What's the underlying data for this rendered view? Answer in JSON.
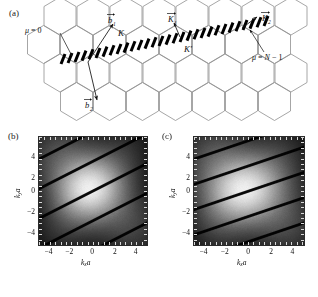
{
  "figure": {
    "panels": [
      {
        "id": "a",
        "label": "(a)",
        "type": "lattice-diagram"
      },
      {
        "id": "b",
        "label": "(b)",
        "type": "heatmap"
      },
      {
        "id": "c",
        "label": "(c)",
        "type": "heatmap"
      }
    ]
  },
  "panel_a": {
    "label": "(a)",
    "description": "Hexagonal reciprocal lattice of graphene with cutting lines",
    "annotations": [
      {
        "name": "mu-zero",
        "text": "μ = 0"
      },
      {
        "name": "mu-n-minus-one",
        "text": "μ = N − 1"
      },
      {
        "name": "k-point",
        "text": "K"
      },
      {
        "name": "k-prime-point",
        "text": "K′"
      },
      {
        "name": "b1-vector",
        "text": "b",
        "sub": "1",
        "accent": "vector"
      },
      {
        "name": "b2-vector",
        "text": "b",
        "sub": "2",
        "accent": "vector"
      },
      {
        "name": "k1-vector",
        "text": "K",
        "sub": "1",
        "accent": "vector"
      },
      {
        "name": "k2-vector",
        "text": "K",
        "sub": "2",
        "accent": "vector"
      }
    ],
    "lattice": {
      "hex_rows": 3,
      "hex_cols": 5,
      "line_color": "#8a8a8a",
      "cutting_line_color": "#000000",
      "cutting_line_style": "thick-dashed-slanted"
    }
  },
  "chart_data": [
    {
      "panel": "b",
      "type": "heatmap",
      "title": "(b)",
      "xlabel": "k",
      "xlabel_sub": "x",
      "xlabel_suffix": "a",
      "ylabel": "k",
      "ylabel_sub": "y",
      "ylabel_suffix": "a",
      "xticks": [
        -4,
        -2,
        0,
        2,
        4
      ],
      "xticklabels": [
        "−4",
        "−2",
        "0",
        "2",
        "4"
      ],
      "yticks": [
        -4,
        -2,
        0,
        2,
        4
      ],
      "yticklabels": [
        "−4",
        "−2",
        "0",
        "2",
        "4"
      ],
      "xlim": [
        -5.2,
        5.2
      ],
      "ylim": [
        -5.2,
        5.2
      ],
      "colormap": "grayscale",
      "grid": false,
      "cutting_lines": {
        "count": 4,
        "slope_deg": 27,
        "spacing": 2.55,
        "color": "#000000"
      },
      "intensity": {
        "peak_value": 1.0,
        "peak_center": [
          -0.3,
          0.2
        ],
        "sigma_x": 2.3,
        "sigma_y": 2.1,
        "background": 0.0
      }
    },
    {
      "panel": "c",
      "type": "heatmap",
      "title": "(c)",
      "xlabel": "k",
      "xlabel_sub": "x",
      "xlabel_suffix": "a",
      "ylabel": "k",
      "ylabel_sub": "y",
      "ylabel_suffix": "a",
      "xticks": [
        -4,
        -2,
        0,
        2,
        4
      ],
      "xticklabels": [
        "−4",
        "−2",
        "0",
        "2",
        "4"
      ],
      "yticks": [
        -4,
        -2,
        0,
        2,
        4
      ],
      "yticklabels": [
        "−4",
        "−2",
        "0",
        "2",
        "4"
      ],
      "xlim": [
        -5.2,
        5.2
      ],
      "ylim": [
        -5.2,
        5.2
      ],
      "colormap": "grayscale",
      "grid": false,
      "cutting_lines": {
        "count": 4,
        "slope_deg": 19,
        "spacing": 2.3,
        "color": "#000000"
      },
      "intensity": {
        "peak_value": 1.0,
        "peak_center": [
          -0.4,
          0.1
        ],
        "sigma_x": 2.6,
        "sigma_y": 2.2,
        "background": 0.0
      }
    }
  ],
  "colors": {
    "lattice_line": "#8a8a8a",
    "cutting_line": "#000000",
    "text": "#111111",
    "frame": "#2b2b2b",
    "tick": "#d8d8d8",
    "background": "#ffffff"
  }
}
